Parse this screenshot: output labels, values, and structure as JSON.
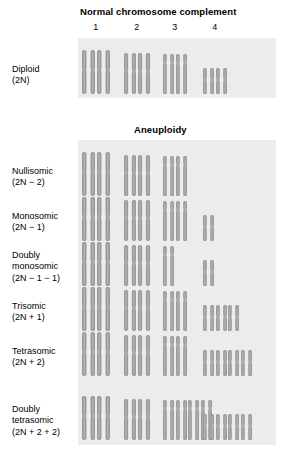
{
  "figure": {
    "headings": {
      "normal": "Normal chromosome complement",
      "aneuploidy": "Aneuploidy"
    },
    "column_numbers": [
      "1",
      "2",
      "3",
      "4"
    ],
    "colors": {
      "panel_background": "#ececed",
      "chromosome_fill": "#9a9a9a",
      "chromosome_highlight": "#bcbcbc",
      "page_background": "#ffffff",
      "text": "#000000"
    }
  },
  "chart_data": {
    "type": "table",
    "xlabel": "Chromosome",
    "ylabel": "Karyotype condition",
    "categories": [
      "1",
      "2",
      "3",
      "4"
    ],
    "series": [
      {
        "name": "Diploid (2N)",
        "values": [
          2,
          2,
          2,
          2
        ]
      },
      {
        "name": "Nullisomic (2N − 2)",
        "values": [
          2,
          2,
          2,
          0
        ]
      },
      {
        "name": "Monosomic (2N − 1)",
        "values": [
          2,
          2,
          2,
          1
        ]
      },
      {
        "name": "Doubly monosomic (2N − 1 − 1)",
        "values": [
          2,
          2,
          1,
          1
        ]
      },
      {
        "name": "Trisomic (2N + 1)",
        "values": [
          2,
          2,
          2,
          3
        ]
      },
      {
        "name": "Tetrasomic (2N + 2)",
        "values": [
          2,
          2,
          2,
          4
        ]
      },
      {
        "name": "Doubly tetrasomic (2N + 2 + 2)",
        "values": [
          2,
          2,
          4,
          4
        ]
      }
    ],
    "legend_position": "none",
    "grid": false
  },
  "rows": [
    {
      "id": "diploid",
      "name": "Diploid",
      "formula": "(2N)",
      "counts": [
        2,
        2,
        2,
        2
      ],
      "group": "normal"
    },
    {
      "id": "nullisomic",
      "name": "Nullisomic",
      "formula": "(2N − 2)",
      "counts": [
        2,
        2,
        2,
        0
      ],
      "group": "aneuploidy"
    },
    {
      "id": "monosomic",
      "name": "Monosomic",
      "formula": "(2N − 1)",
      "counts": [
        2,
        2,
        2,
        1
      ],
      "group": "aneuploidy"
    },
    {
      "id": "doubly-monosomic",
      "name": "Doubly\nmonosomic",
      "formula": "(2N − 1 − 1)",
      "counts": [
        2,
        2,
        1,
        1
      ],
      "group": "aneuploidy"
    },
    {
      "id": "trisomic",
      "name": "Trisomic",
      "formula": "(2N + 1)",
      "counts": [
        2,
        2,
        2,
        3
      ],
      "group": "aneuploidy"
    },
    {
      "id": "tetrasomic",
      "name": "Tetrasomic",
      "formula": "(2N + 2)",
      "counts": [
        2,
        2,
        2,
        4
      ],
      "group": "aneuploidy"
    },
    {
      "id": "doubly-tetrasomic",
      "name": "Doubly\ntetrasomic",
      "formula": "(2N + 2 + 2)",
      "counts": [
        2,
        2,
        4,
        4
      ],
      "group": "aneuploidy"
    }
  ]
}
